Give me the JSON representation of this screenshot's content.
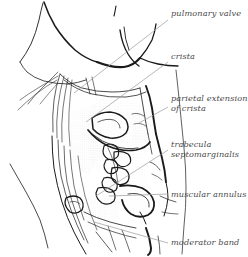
{
  "figure": {
    "style": "ink line drawing with stipple shading",
    "background_color": "#ffffff",
    "ink_color": "#1a1a1a",
    "leader_line_color": "#9a9a9a",
    "label_text_color": "#4a4a4a",
    "stipple_color": "#b9b9b9"
  },
  "labels": [
    {
      "id": "pulmonary-valve",
      "text": "pulmonary valve",
      "lines": [
        "pulmonary valve"
      ],
      "x": 171,
      "y": 9,
      "leader": {
        "x1": 168,
        "y1": 20,
        "x2": 74,
        "y2": 93
      }
    },
    {
      "id": "crista",
      "text": "crista",
      "lines": [
        "crista"
      ],
      "x": 171,
      "y": 52,
      "leader": {
        "x1": 168,
        "y1": 62,
        "x2": 86,
        "y2": 122
      }
    },
    {
      "id": "parietal-extension-of-crista",
      "text": "parietal extension of crista",
      "lines": [
        "parietal extension",
        "of crista"
      ],
      "x": 171,
      "y": 94,
      "leader": {
        "x1": 168,
        "y1": 107,
        "x2": 139,
        "y2": 123
      }
    },
    {
      "id": "trabecula-septomarginalis",
      "text": "trabecula septomarginalis",
      "lines": [
        "trabecula",
        "septomarginalis"
      ],
      "x": 171,
      "y": 140,
      "leader": {
        "x1": 168,
        "y1": 150,
        "x2": 96,
        "y2": 196
      }
    },
    {
      "id": "muscular-annulus",
      "text": "muscular annulus",
      "lines": [
        "muscular annulus"
      ],
      "x": 171,
      "y": 190,
      "leader": {
        "x1": 168,
        "y1": 194,
        "x2": 109,
        "y2": 196
      }
    },
    {
      "id": "moderator-band",
      "text": "moderator band",
      "lines": [
        "moderator band"
      ],
      "x": 171,
      "y": 238,
      "leader": {
        "x1": 168,
        "y1": 243,
        "x2": 94,
        "y2": 222
      }
    }
  ]
}
